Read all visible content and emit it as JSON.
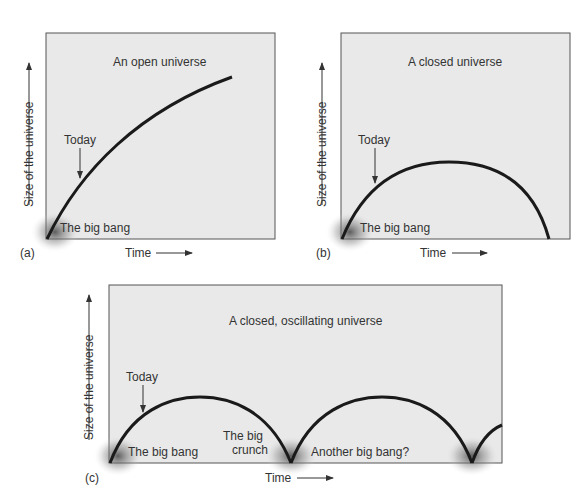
{
  "panels": [
    {
      "letter": "(a)",
      "title": "An open universe",
      "today_label": "Today",
      "start_label": "The big bang",
      "xlabel": "Time",
      "ylabel": "Size of the universe"
    },
    {
      "letter": "(b)",
      "title": "A closed universe",
      "today_label": "Today",
      "start_label": "The big bang",
      "xlabel": "Time",
      "ylabel": "Size of the universe"
    },
    {
      "letter": "(c)",
      "title": "A closed, oscillating universe",
      "today_label": "Today",
      "start_label": "The big bang",
      "crunch_label_1": "The big",
      "crunch_label_2": "crunch",
      "another_label": "Another big bang?",
      "xlabel": "Time",
      "ylabel": "Size of the universe"
    }
  ],
  "colors": {
    "panel_bg": "#e9e9e9",
    "curve": "#1a1a1a",
    "border": "#555555"
  }
}
